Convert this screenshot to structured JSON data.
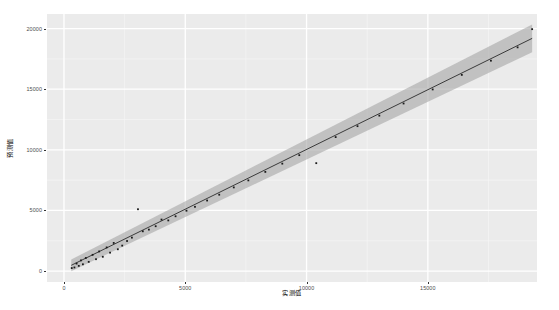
{
  "chart_data": {
    "type": "scatter",
    "title": "",
    "subtitle": "",
    "xlabel": "实测值",
    "ylabel": "预测值",
    "xlim": [
      -700,
      19500
    ],
    "ylim": [
      -900,
      21200
    ],
    "xticks": [
      0,
      5000,
      10000,
      15000
    ],
    "xticklabels": [
      "0",
      "5000",
      "10000",
      "15000"
    ],
    "yticks": [
      0,
      5000,
      10000,
      15000,
      20000
    ],
    "yticklabels": [
      "0",
      "5000",
      "10000",
      "15000",
      "20000"
    ],
    "grid": true,
    "grid_major_color": "#ffffff",
    "grid_minor_color": "#f5f5f5",
    "panel_background": "#ebebeb",
    "legend": "none",
    "point_color": "#1a1a1a",
    "line_color": "#2b2b2b",
    "band_color": "#9f9f9f",
    "fit": {
      "type": "linear",
      "intercept": 180,
      "slope": 0.985,
      "x_start": 300,
      "x_end": 19300,
      "band_half_width_start": 480,
      "band_half_width_end": 1150
    },
    "series": [
      {
        "name": "观测点",
        "points": [
          [
            320,
            250
          ],
          [
            430,
            300
          ],
          [
            520,
            620
          ],
          [
            610,
            430
          ],
          [
            700,
            880
          ],
          [
            780,
            560
          ],
          [
            900,
            1080
          ],
          [
            1020,
            760
          ],
          [
            1180,
            1340
          ],
          [
            1320,
            980
          ],
          [
            1450,
            1620
          ],
          [
            1600,
            1180
          ],
          [
            1760,
            1950
          ],
          [
            1900,
            1520
          ],
          [
            2050,
            2320
          ],
          [
            2220,
            1800
          ],
          [
            2400,
            2100
          ],
          [
            2600,
            2480
          ],
          [
            2800,
            2760
          ],
          [
            3050,
            5100
          ],
          [
            3250,
            3280
          ],
          [
            3500,
            3420
          ],
          [
            3780,
            3700
          ],
          [
            4020,
            4250
          ],
          [
            4300,
            4180
          ],
          [
            4600,
            4520
          ],
          [
            5050,
            4980
          ],
          [
            5400,
            5300
          ],
          [
            5900,
            5820
          ],
          [
            6400,
            6300
          ],
          [
            7000,
            6900
          ],
          [
            7600,
            7480
          ],
          [
            8300,
            8180
          ],
          [
            9000,
            8860
          ],
          [
            9700,
            9560
          ],
          [
            10400,
            8900
          ],
          [
            11200,
            11050
          ],
          [
            12100,
            11950
          ],
          [
            13000,
            12820
          ],
          [
            14000,
            13820
          ],
          [
            15200,
            14980
          ],
          [
            16400,
            16180
          ],
          [
            17600,
            17350
          ],
          [
            18700,
            18450
          ],
          [
            19300,
            19950
          ]
        ]
      }
    ]
  },
  "axis": {
    "x_title": "实测值",
    "y_title": "预测值"
  }
}
